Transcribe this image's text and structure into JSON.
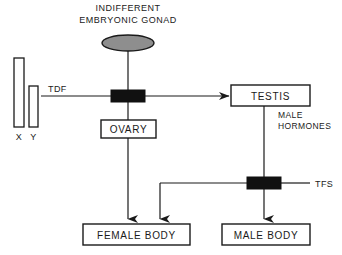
{
  "diagram": {
    "title_line1": "INDIFFERENT",
    "title_line2": "EMBRYONIC GONAD",
    "nodes": {
      "gonad": {
        "label": ""
      },
      "ovary": {
        "label": "OVARY"
      },
      "testis": {
        "label": "TESTIS"
      },
      "female_body": {
        "label": "FEMALE BODY"
      },
      "male_body": {
        "label": "MALE BODY"
      }
    },
    "chromosomes": {
      "x_label": "X",
      "y_label": "Y"
    },
    "signals": {
      "tdf": "TDF",
      "tfs": "TFS",
      "male_hormones_line1": "MALE",
      "male_hormones_line2": "HORMONES"
    },
    "colors": {
      "stroke": "#1a1a1a",
      "gonad_fill": "#8e8e8e",
      "gate_fill": "#111111",
      "background": "#ffffff"
    }
  }
}
